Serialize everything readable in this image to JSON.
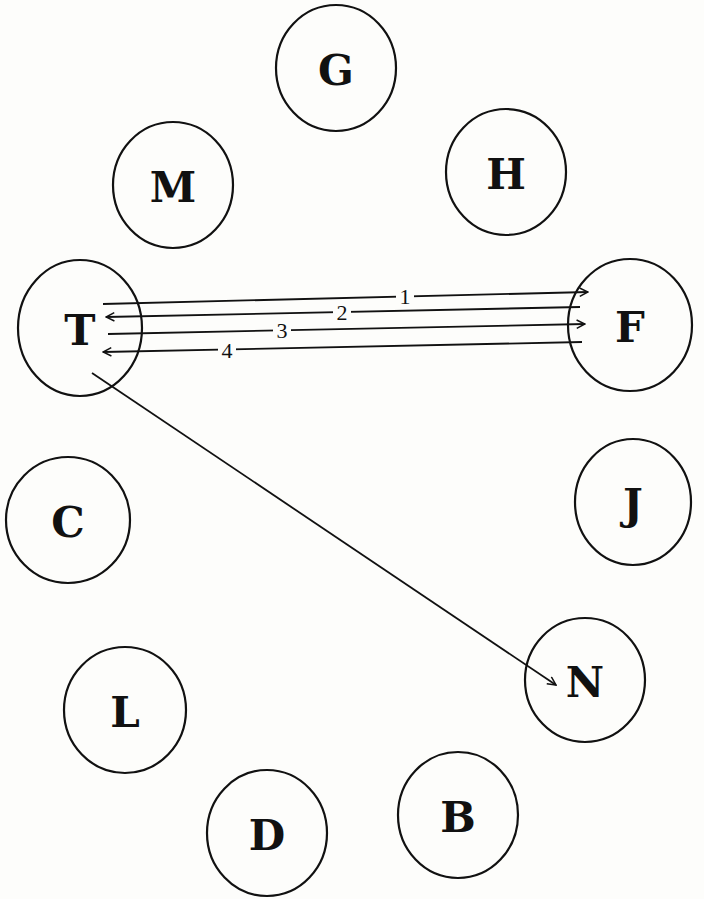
{
  "nodes": [
    {
      "id": "G",
      "label": "G",
      "cx": 336,
      "cy": 68,
      "rx": 60,
      "ry": 63
    },
    {
      "id": "M",
      "label": "M",
      "cx": 173,
      "cy": 185,
      "rx": 60,
      "ry": 63
    },
    {
      "id": "H",
      "label": "H",
      "cx": 506,
      "cy": 172,
      "rx": 60,
      "ry": 63
    },
    {
      "id": "T",
      "label": "T",
      "cx": 80,
      "cy": 328,
      "rx": 62,
      "ry": 68
    },
    {
      "id": "F",
      "label": "F",
      "cx": 630,
      "cy": 325,
      "rx": 62,
      "ry": 66
    },
    {
      "id": "C",
      "label": "C",
      "cx": 68,
      "cy": 520,
      "rx": 62,
      "ry": 63
    },
    {
      "id": "J",
      "label": "J",
      "cx": 633,
      "cy": 502,
      "rx": 58,
      "ry": 63
    },
    {
      "id": "L",
      "label": "L",
      "cx": 125,
      "cy": 710,
      "rx": 61,
      "ry": 63
    },
    {
      "id": "N",
      "label": "N",
      "cx": 585,
      "cy": 680,
      "rx": 60,
      "ry": 62
    },
    {
      "id": "D",
      "label": "D",
      "cx": 267,
      "cy": 833,
      "rx": 60,
      "ry": 63
    },
    {
      "id": "B",
      "label": "B",
      "cx": 458,
      "cy": 815,
      "rx": 60,
      "ry": 63
    }
  ],
  "edges": [
    {
      "id": "e1",
      "from": "T",
      "to": "F",
      "label": "1",
      "x1": 103,
      "y1": 304,
      "x2": 588,
      "y2": 292,
      "lx": 405,
      "ly": 296
    },
    {
      "id": "e2",
      "from": "F",
      "to": "T",
      "label": "2",
      "x1": 580,
      "y1": 307,
      "x2": 106,
      "y2": 317,
      "lx": 342,
      "ly": 312
    },
    {
      "id": "e3",
      "from": "T",
      "to": "F",
      "label": "3",
      "x1": 108,
      "y1": 334,
      "x2": 585,
      "y2": 324,
      "lx": 282,
      "ly": 330
    },
    {
      "id": "e4",
      "from": "F",
      "to": "T",
      "label": "4",
      "x1": 582,
      "y1": 342,
      "x2": 103,
      "y2": 352,
      "lx": 227,
      "ly": 350
    },
    {
      "id": "e5",
      "from": "T",
      "to": "N",
      "label": "",
      "x1": 92,
      "y1": 373,
      "x2": 556,
      "y2": 685,
      "lx": 0,
      "ly": 0
    }
  ]
}
